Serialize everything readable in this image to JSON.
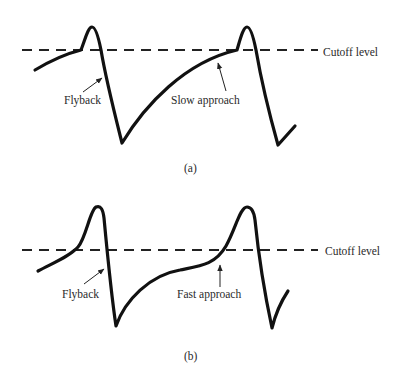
{
  "figure": {
    "panels": [
      {
        "id": "a",
        "caption": "(a)",
        "cutoff_label": "Cutoff level",
        "annotations": {
          "flyback": "Flyback",
          "approach": "Slow approach"
        }
      },
      {
        "id": "b",
        "caption": "(b)",
        "cutoff_label": "Cutoff level",
        "annotations": {
          "flyback": "Flyback",
          "approach": "Fast approach"
        }
      }
    ],
    "colors": {
      "stroke": "#111111",
      "text": "#2a2a2a",
      "background": "#ffffff"
    }
  }
}
